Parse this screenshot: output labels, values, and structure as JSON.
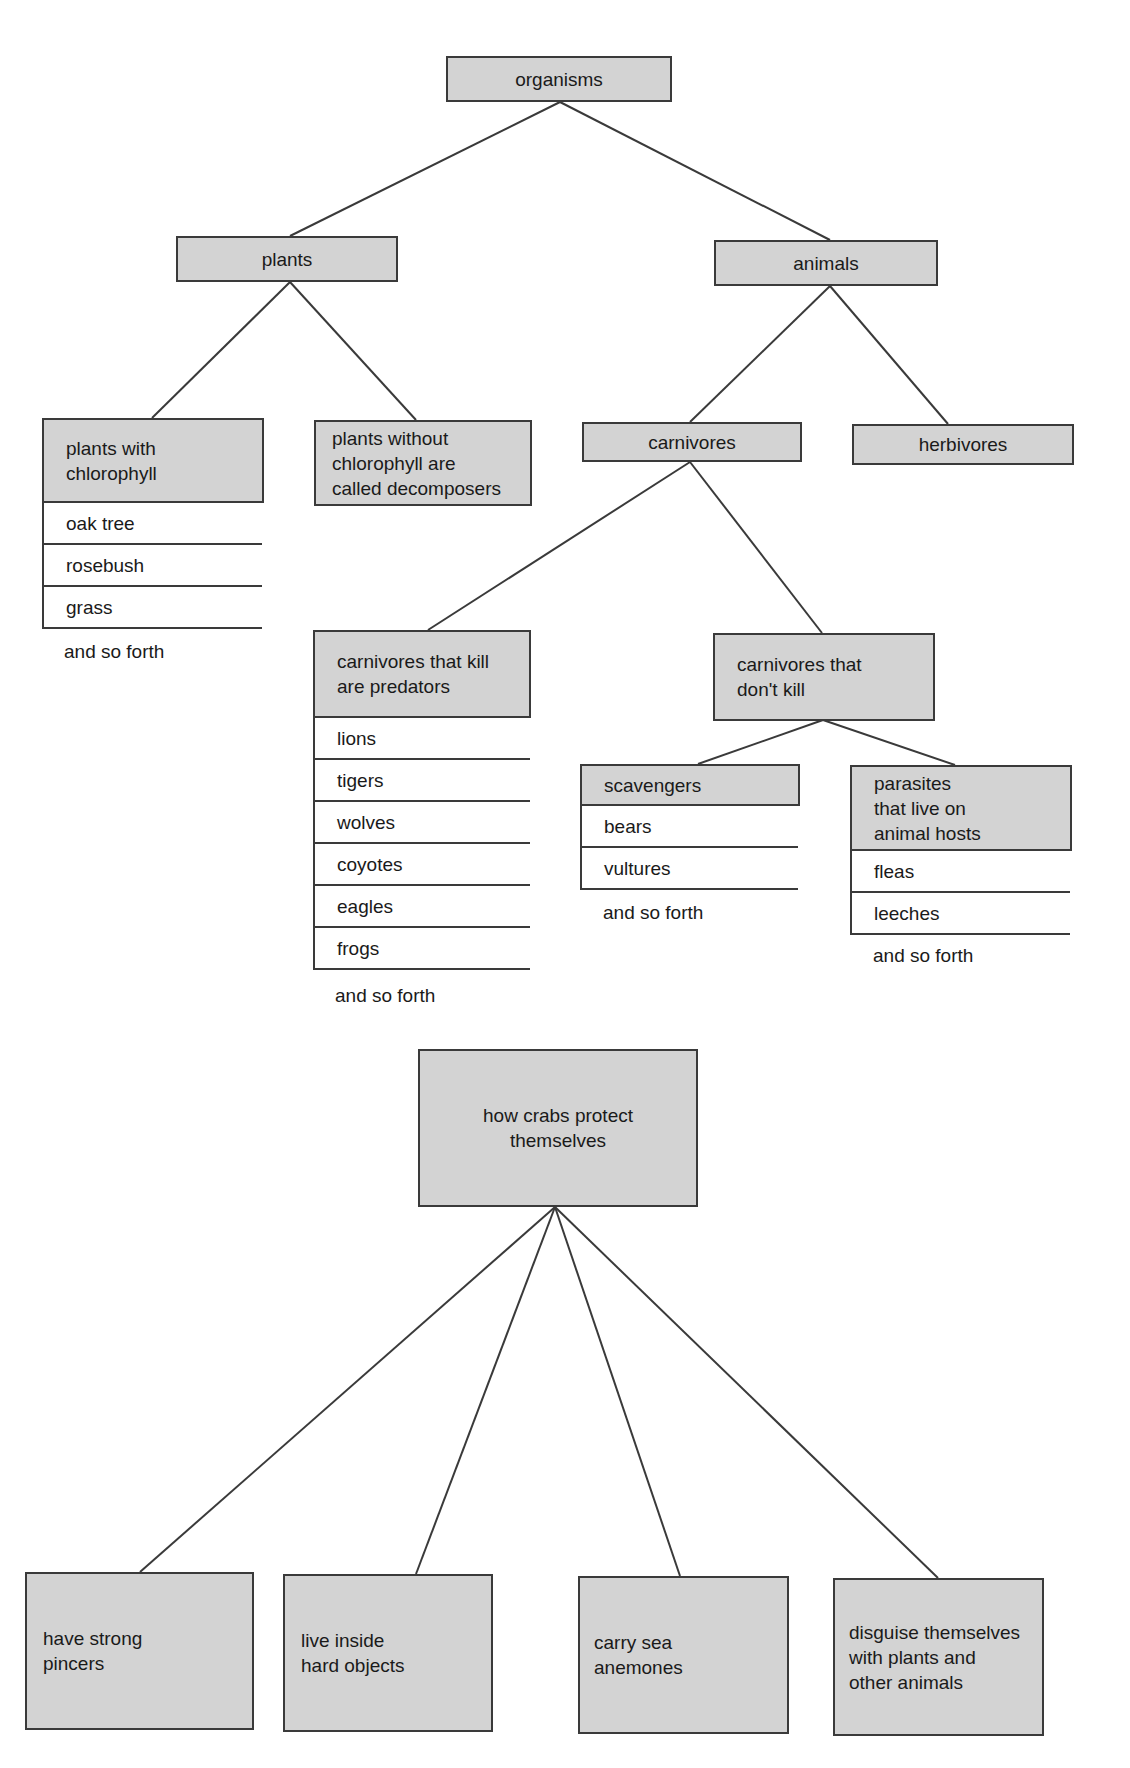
{
  "diagram1": {
    "root": "organisms",
    "plants": {
      "label": "plants",
      "with_chlorophyll": {
        "label_lines": [
          "plants with",
          "chlorophyll"
        ],
        "examples": [
          "oak tree",
          "rosebush",
          "grass"
        ],
        "more": "and so forth"
      },
      "without_chlorophyll": {
        "label_lines": [
          "plants without",
          "chlorophyll are",
          "called decomposers"
        ]
      }
    },
    "animals": {
      "label": "animals",
      "carnivores": {
        "label": "carnivores",
        "predators": {
          "label_lines": [
            "carnivores that kill",
            "are predators"
          ],
          "examples": [
            "lions",
            "tigers",
            "wolves",
            "coyotes",
            "eagles",
            "frogs"
          ],
          "more": "and so forth"
        },
        "non_killers": {
          "label_lines": [
            "carnivores that",
            "don't kill"
          ],
          "scavengers": {
            "label": "scavengers",
            "examples": [
              "bears",
              "vultures"
            ],
            "more": "and so forth"
          },
          "parasites": {
            "label_lines": [
              "parasites",
              "that live on",
              "animal hosts"
            ],
            "examples": [
              "fleas",
              "leeches"
            ],
            "more": "and so forth"
          }
        }
      },
      "herbivores": {
        "label": "herbivores"
      }
    }
  },
  "diagram2": {
    "root_lines": [
      "how crabs protect",
      "themselves"
    ],
    "children": [
      {
        "lines": [
          "have strong",
          "pincers"
        ]
      },
      {
        "lines": [
          "live inside",
          "hard objects"
        ]
      },
      {
        "lines": [
          "carry sea",
          "anemones"
        ]
      },
      {
        "lines": [
          "disguise themselves",
          "with plants and",
          "other animals"
        ]
      }
    ]
  },
  "colors": {
    "box_fill": "#d3d3d3",
    "line": "#3a3a3a",
    "background": "#ffffff"
  }
}
